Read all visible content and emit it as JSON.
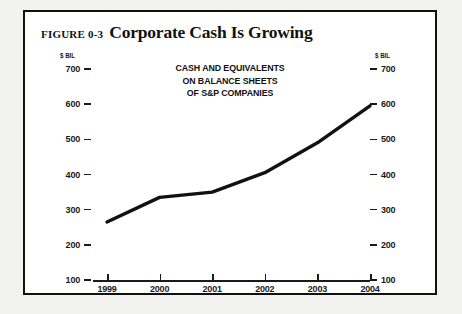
{
  "figure": {
    "label": "FIGURE 0-3",
    "title": "Corporate Cash Is Growing",
    "border_color": "#111111",
    "background_color": "#ffffff",
    "page_color": "#f2f2f1"
  },
  "chart_data": {
    "type": "line",
    "title": "Corporate Cash Is Growing",
    "annotation": [
      "CASH AND EQUIVALENTS",
      "ON BALANCE SHEETS",
      "OF S&P COMPANIES"
    ],
    "categories": [
      "1999",
      "2000",
      "2001",
      "2002",
      "2003",
      "2004"
    ],
    "x": [
      1999,
      2000,
      2001,
      2002,
      2003,
      2004
    ],
    "values": [
      265,
      335,
      350,
      405,
      490,
      595
    ],
    "series": [
      {
        "name": "Cash and equivalents on balance sheets of S&P companies",
        "values": [
          265,
          335,
          350,
          405,
          490,
          595
        ]
      }
    ],
    "xlabel": "",
    "ylabel": "$ BIL",
    "ylabel_right": "$ BIL",
    "ylim": [
      100,
      700
    ],
    "yticks": [
      700,
      600,
      500,
      400,
      300,
      200,
      100
    ],
    "ytick_labels": [
      "700",
      "600",
      "500",
      "400",
      "300",
      "200",
      "100"
    ],
    "grid": false,
    "legend": "none",
    "line_color": "#111111",
    "line_width": 3.4,
    "dual_axis": true
  }
}
